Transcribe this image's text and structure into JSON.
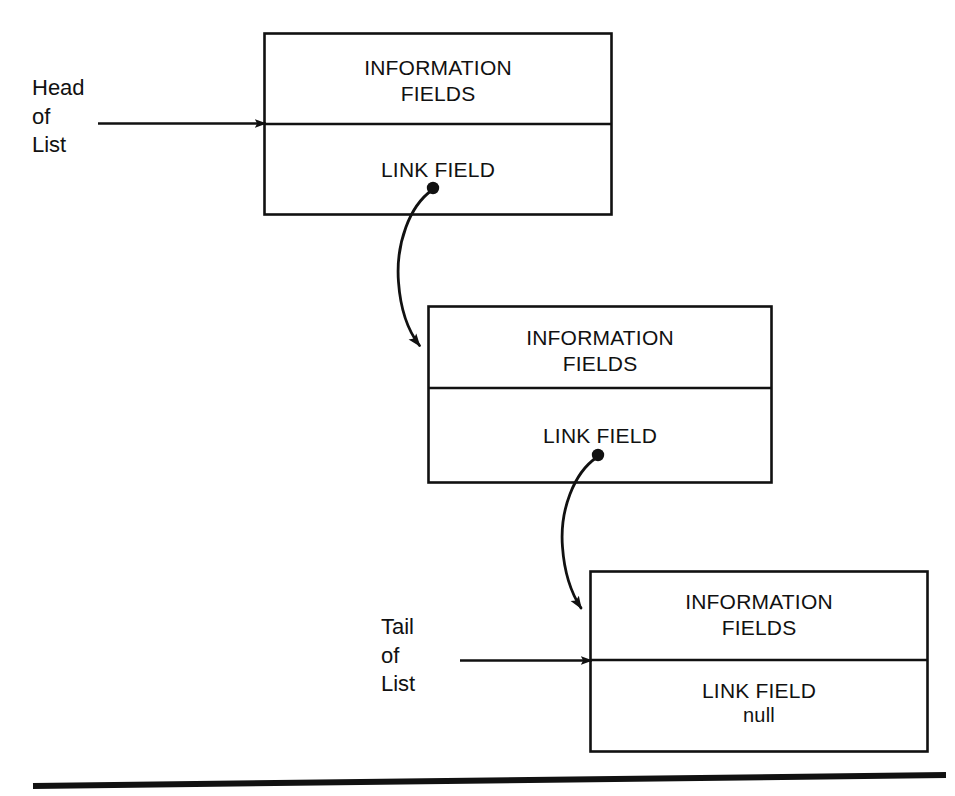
{
  "diagram": {
    "stroke_color": "#111111",
    "background_color": "#ffffff",
    "rule": {
      "label": "bottom-rule"
    },
    "pointers": [
      {
        "id": "head",
        "name": "head-of-list-pointer",
        "label": "Head\nof\nList",
        "arrow_label": "head-pointer-arrow"
      },
      {
        "id": "tail",
        "name": "tail-of-list-pointer",
        "label": "Tail\nof\nList",
        "arrow_label": "tail-pointer-arrow"
      }
    ],
    "nodes": [
      {
        "id": "node1",
        "name": "list-node-1",
        "info_label": "INFORMATION\nFIELDS",
        "link_label": "LINK FIELD",
        "link_value": "",
        "has_link_dot": true
      },
      {
        "id": "node2",
        "name": "list-node-2",
        "info_label": "INFORMATION\nFIELDS",
        "link_label": "LINK FIELD",
        "link_value": "",
        "has_link_dot": true
      },
      {
        "id": "node3",
        "name": "list-node-3",
        "info_label": "INFORMATION\nFIELDS",
        "link_label": "LINK FIELD",
        "link_value": "null",
        "has_link_dot": false
      }
    ],
    "links": [
      {
        "id": "link1",
        "name": "link-curve-node1-to-node2",
        "from": "node1",
        "to": "node2"
      },
      {
        "id": "link2",
        "name": "link-curve-node2-to-node3",
        "from": "node2",
        "to": "node3"
      }
    ]
  }
}
